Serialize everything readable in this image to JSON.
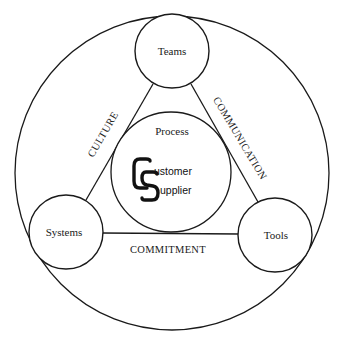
{
  "diagram": {
    "outer_circle": {
      "cx": 172,
      "cy": 173,
      "r": 157
    },
    "center": {
      "label": "Process",
      "circle": {
        "cx": 171,
        "cy": 172,
        "r": 60
      },
      "logo": {
        "big_c": "C",
        "big_s": "S",
        "line1_rest": "ustomer",
        "line2_rest": "upplier",
        "full_text": "Customer Supplier"
      }
    },
    "nodes": [
      {
        "id": "teams",
        "label": "Teams",
        "cx": 172,
        "cy": 51,
        "r": 37
      },
      {
        "id": "systems",
        "label": "Systems",
        "cx": 66,
        "cy": 232,
        "r": 37
      },
      {
        "id": "tools",
        "label": "Tools",
        "cx": 275,
        "cy": 235,
        "r": 37
      }
    ],
    "edges": [
      {
        "from": "teams",
        "to": "systems",
        "label": "CULTURE"
      },
      {
        "from": "teams",
        "to": "tools",
        "label": "COMMUNICATION"
      },
      {
        "from": "systems",
        "to": "tools",
        "label": "COMMITMENT"
      }
    ],
    "colors": {
      "stroke": "#1a1a1a",
      "background": "#ffffff"
    }
  }
}
